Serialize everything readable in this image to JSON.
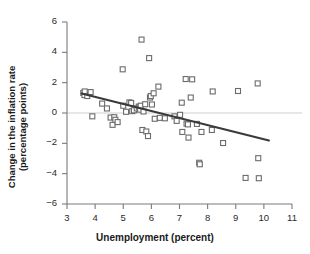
{
  "chart_data": {
    "type": "scatter",
    "title": "",
    "xlabel": "Unemployment (percent)",
    "ylabel": "Change in the inflation rate\n(percentage points)",
    "xlim": [
      3,
      11
    ],
    "ylim": [
      -6,
      6
    ],
    "xticks": [
      3,
      4,
      5,
      6,
      7,
      8,
      9,
      10,
      11
    ],
    "xtick_labels": [
      "3",
      "4",
      "5",
      "6",
      "7",
      "8",
      "9",
      "10",
      "11"
    ],
    "yticks": [
      -6,
      -4,
      -2,
      0,
      2,
      4,
      6
    ],
    "ytick_labels": [
      "−6",
      "−4",
      "−2",
      "0",
      "2",
      "4",
      "6"
    ],
    "grid": false,
    "legend": "none",
    "zero_line": 0,
    "marker": "open-square",
    "marker_color": "#6b6b6b",
    "marker_size": 5,
    "line_color": "#3a3a3a",
    "axis_color": "#7a7a7a",
    "zero_line_color": "#cfcfcf",
    "points": [
      [
        3.58,
        1.32
      ],
      [
        3.62,
        1.18
      ],
      [
        3.63,
        1.42
      ],
      [
        3.72,
        1.12
      ],
      [
        3.84,
        1.38
      ],
      [
        3.9,
        -0.22
      ],
      [
        4.25,
        0.62
      ],
      [
        4.42,
        0.3
      ],
      [
        4.55,
        -0.3
      ],
      [
        4.62,
        -0.78
      ],
      [
        4.68,
        -0.28
      ],
      [
        4.72,
        -0.45
      ],
      [
        4.8,
        -0.6
      ],
      [
        4.98,
        2.88
      ],
      [
        5.0,
        0.48
      ],
      [
        5.1,
        0.08
      ],
      [
        5.22,
        0.7
      ],
      [
        5.28,
        0.66
      ],
      [
        5.32,
        0.12
      ],
      [
        5.38,
        0.18
      ],
      [
        5.48,
        0.3
      ],
      [
        5.55,
        0.42
      ],
      [
        5.58,
        0.36
      ],
      [
        5.6,
        0.22
      ],
      [
        5.62,
        0.48
      ],
      [
        5.65,
        4.84
      ],
      [
        5.68,
        -1.12
      ],
      [
        5.72,
        0.1
      ],
      [
        5.78,
        0.58
      ],
      [
        5.82,
        -1.22
      ],
      [
        5.88,
        -1.52
      ],
      [
        5.92,
        3.62
      ],
      [
        5.95,
        1.02
      ],
      [
        5.98,
        1.12
      ],
      [
        6.02,
        0.56
      ],
      [
        6.08,
        1.3
      ],
      [
        6.12,
        -0.38
      ],
      [
        6.25,
        1.74
      ],
      [
        6.3,
        -0.32
      ],
      [
        6.48,
        -0.35
      ],
      [
        6.82,
        -0.22
      ],
      [
        6.9,
        -0.52
      ],
      [
        7.02,
        -0.12
      ],
      [
        7.08,
        0.68
      ],
      [
        7.1,
        -1.25
      ],
      [
        7.22,
        2.24
      ],
      [
        7.25,
        -0.7
      ],
      [
        7.3,
        -0.75
      ],
      [
        7.32,
        -1.62
      ],
      [
        7.4,
        1.02
      ],
      [
        7.45,
        2.22
      ],
      [
        7.62,
        -0.72
      ],
      [
        7.7,
        -3.28
      ],
      [
        7.72,
        -3.38
      ],
      [
        7.78,
        -1.25
      ],
      [
        8.15,
        -1.12
      ],
      [
        8.18,
        1.42
      ],
      [
        8.55,
        -1.98
      ],
      [
        9.08,
        1.45
      ],
      [
        9.35,
        -4.28
      ],
      [
        9.78,
        1.95
      ],
      [
        9.8,
        -2.98
      ],
      [
        9.82,
        -4.3
      ]
    ],
    "trend_line": {
      "x1": 3.52,
      "y1": 1.28,
      "x2": 10.18,
      "y2": -1.82
    }
  }
}
